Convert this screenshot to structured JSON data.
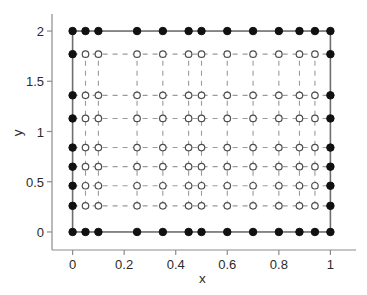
{
  "chart_data": {
    "type": "scatter",
    "title": "",
    "xlabel": "x",
    "ylabel": "y",
    "xlim": [
      -0.045,
      1.045
    ],
    "ylim": [
      -0.09,
      2.09
    ],
    "xticks": [
      0,
      0.2,
      0.4,
      0.6,
      0.8,
      1
    ],
    "xticklabels": [
      "0",
      "0.2",
      "0.4",
      "0.6",
      "0.8",
      "1"
    ],
    "yticks": [
      0,
      0.5,
      1,
      1.5,
      2
    ],
    "yticklabels": [
      "0",
      "0.5",
      "1",
      "1.5",
      "2"
    ],
    "grid": false,
    "legend": null,
    "x_gridlines": [
      0,
      0.05,
      0.1,
      0.25,
      0.35,
      0.45,
      0.5,
      0.6,
      0.7,
      0.8,
      0.88,
      0.94,
      1
    ],
    "y_gridlines": [
      0,
      0.26,
      0.46,
      0.65,
      0.84,
      1.13,
      1.36,
      1.77,
      2
    ],
    "series": [
      {
        "name": "boundary-nodes",
        "marker": "filled-circle",
        "color": "#111111",
        "marker_size": 7.5,
        "points": [
          [
            0,
            0
          ],
          [
            0.05,
            0
          ],
          [
            0.1,
            0
          ],
          [
            0.25,
            0
          ],
          [
            0.35,
            0
          ],
          [
            0.45,
            0
          ],
          [
            0.5,
            0
          ],
          [
            0.6,
            0
          ],
          [
            0.7,
            0
          ],
          [
            0.8,
            0
          ],
          [
            0.88,
            0
          ],
          [
            0.94,
            0
          ],
          [
            1,
            0
          ],
          [
            0,
            2
          ],
          [
            0.05,
            2
          ],
          [
            0.1,
            2
          ],
          [
            0.25,
            2
          ],
          [
            0.35,
            2
          ],
          [
            0.45,
            2
          ],
          [
            0.5,
            2
          ],
          [
            0.6,
            2
          ],
          [
            0.7,
            2
          ],
          [
            0.8,
            2
          ],
          [
            0.88,
            2
          ],
          [
            0.94,
            2
          ],
          [
            1,
            2
          ],
          [
            0,
            0.26
          ],
          [
            0,
            0.46
          ],
          [
            0,
            0.65
          ],
          [
            0,
            0.84
          ],
          [
            0,
            1.13
          ],
          [
            0,
            1.36
          ],
          [
            0,
            1.77
          ],
          [
            1,
            0.26
          ],
          [
            1,
            0.46
          ],
          [
            1,
            0.65
          ],
          [
            1,
            0.84
          ],
          [
            1,
            1.13
          ],
          [
            1,
            1.36
          ],
          [
            1,
            1.77
          ]
        ]
      },
      {
        "name": "interior-nodes",
        "marker": "open-circle",
        "color": "#4d4d4d",
        "marker_size": 6.5,
        "points": [
          [
            0.05,
            0.26
          ],
          [
            0.1,
            0.26
          ],
          [
            0.25,
            0.26
          ],
          [
            0.35,
            0.26
          ],
          [
            0.45,
            0.26
          ],
          [
            0.5,
            0.26
          ],
          [
            0.6,
            0.26
          ],
          [
            0.7,
            0.26
          ],
          [
            0.8,
            0.26
          ],
          [
            0.88,
            0.26
          ],
          [
            0.94,
            0.26
          ],
          [
            0.05,
            0.46
          ],
          [
            0.1,
            0.46
          ],
          [
            0.25,
            0.46
          ],
          [
            0.35,
            0.46
          ],
          [
            0.45,
            0.46
          ],
          [
            0.5,
            0.46
          ],
          [
            0.6,
            0.46
          ],
          [
            0.7,
            0.46
          ],
          [
            0.8,
            0.46
          ],
          [
            0.88,
            0.46
          ],
          [
            0.94,
            0.46
          ],
          [
            0.05,
            0.65
          ],
          [
            0.1,
            0.65
          ],
          [
            0.25,
            0.65
          ],
          [
            0.35,
            0.65
          ],
          [
            0.45,
            0.65
          ],
          [
            0.5,
            0.65
          ],
          [
            0.6,
            0.65
          ],
          [
            0.7,
            0.65
          ],
          [
            0.8,
            0.65
          ],
          [
            0.88,
            0.65
          ],
          [
            0.94,
            0.65
          ],
          [
            0.05,
            0.84
          ],
          [
            0.1,
            0.84
          ],
          [
            0.25,
            0.84
          ],
          [
            0.35,
            0.84
          ],
          [
            0.45,
            0.84
          ],
          [
            0.5,
            0.84
          ],
          [
            0.6,
            0.84
          ],
          [
            0.7,
            0.84
          ],
          [
            0.8,
            0.84
          ],
          [
            0.88,
            0.84
          ],
          [
            0.94,
            0.84
          ],
          [
            0.05,
            1.13
          ],
          [
            0.1,
            1.13
          ],
          [
            0.25,
            1.13
          ],
          [
            0.35,
            1.13
          ],
          [
            0.45,
            1.13
          ],
          [
            0.5,
            1.13
          ],
          [
            0.6,
            1.13
          ],
          [
            0.7,
            1.13
          ],
          [
            0.8,
            1.13
          ],
          [
            0.88,
            1.13
          ],
          [
            0.94,
            1.13
          ],
          [
            0.05,
            1.36
          ],
          [
            0.1,
            1.36
          ],
          [
            0.25,
            1.36
          ],
          [
            0.35,
            1.36
          ],
          [
            0.45,
            1.36
          ],
          [
            0.5,
            1.36
          ],
          [
            0.6,
            1.36
          ],
          [
            0.7,
            1.36
          ],
          [
            0.8,
            1.36
          ],
          [
            0.88,
            1.36
          ],
          [
            0.94,
            1.36
          ],
          [
            0.05,
            1.77
          ],
          [
            0.1,
            1.77
          ],
          [
            0.25,
            1.77
          ],
          [
            0.35,
            1.77
          ],
          [
            0.45,
            1.77
          ],
          [
            0.5,
            1.77
          ],
          [
            0.6,
            1.77
          ],
          [
            0.7,
            1.77
          ],
          [
            0.8,
            1.77
          ],
          [
            0.88,
            1.77
          ],
          [
            0.94,
            1.77
          ]
        ]
      }
    ],
    "styles": {
      "box_color": "#6e6e6e",
      "box_width": 1.6,
      "dash_color": "#9a9a9a",
      "dash_width": 1.1,
      "dash_pattern": "5 5",
      "axis_color": "#8c8c8c",
      "tick_color": "#8c8c8c",
      "background": "#ffffff"
    }
  }
}
